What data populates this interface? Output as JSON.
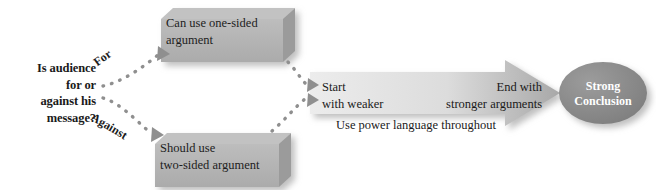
{
  "diagram": {
    "question": "Is audience\nfor or\nagainst his\nmessage?",
    "branches": [
      {
        "label": "For",
        "name": "branch-for"
      },
      {
        "label": "Against",
        "name": "branch-against"
      }
    ],
    "boxes": [
      {
        "name": "box-one-sided",
        "label": "Can use one-sided\nargument"
      },
      {
        "name": "box-two-sided",
        "label": "Should use\ntwo-sided argument"
      }
    ],
    "arrow": {
      "start_label": "Start\nwith weaker",
      "end_label": "End with\nstronger arguments",
      "caption": "Use power language throughout"
    },
    "conclusion": {
      "label": "Strong\nConclusion"
    },
    "colors": {
      "background": "#ffffff",
      "box_fill": "#b3b3b3",
      "box_bevel": "#9a9a9a",
      "box_shadow": "#c9c9c9",
      "arrow_light": "#e6e6e6",
      "arrow_dark": "#a6a6a6",
      "conclusion_fill": "#8c8c8c",
      "dot": "#8f8f8f",
      "text": "#1a1a1a",
      "text_on_dark": "#ffffff"
    }
  }
}
